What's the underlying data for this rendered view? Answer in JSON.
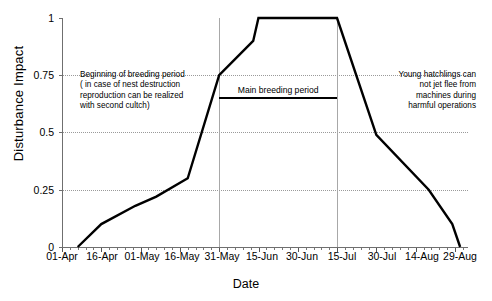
{
  "chart_data": {
    "type": "line",
    "title": "",
    "xlabel": "Date",
    "ylabel": "Disturbance Impact",
    "ylim": [
      0,
      1
    ],
    "yticks": [
      "0",
      "0.25",
      "0.5",
      "0.75",
      "1"
    ],
    "ytick_values": [
      0,
      0.25,
      0.5,
      0.75,
      1
    ],
    "grid": "horizontal-dotted",
    "legend": "none",
    "categories": [
      "01-Apr",
      "16-Apr",
      "01-May",
      "16-May",
      "31-May",
      "15-Jun",
      "30-Jun",
      "15-Jul",
      "30-Jul",
      "14-Aug",
      "29-Aug"
    ],
    "xtick_day_offsets": [
      0,
      15,
      30,
      45,
      60,
      75,
      90,
      105,
      120,
      135,
      150
    ],
    "series": [
      {
        "name": "Disturbance Impact",
        "points": [
          {
            "day": 6,
            "date": "07-Apr",
            "value": 0.0
          },
          {
            "day": 15,
            "date": "16-Apr",
            "value": 0.1
          },
          {
            "day": 28,
            "date": "29-Apr",
            "value": 0.18
          },
          {
            "day": 36,
            "date": "07-May",
            "value": 0.22
          },
          {
            "day": 48,
            "date": "19-May",
            "value": 0.3
          },
          {
            "day": 60,
            "date": "31-May",
            "value": 0.75
          },
          {
            "day": 73,
            "date": "13-Jun",
            "value": 0.9
          },
          {
            "day": 75,
            "date": "15-Jun",
            "value": 1.0
          },
          {
            "day": 105,
            "date": "15-Jul",
            "value": 1.0
          },
          {
            "day": 120,
            "date": "30-Jul",
            "value": 0.49
          },
          {
            "day": 140,
            "date": "19-Aug",
            "value": 0.25
          },
          {
            "day": 149,
            "date": "28-Aug",
            "value": 0.1
          },
          {
            "day": 152,
            "date": "31-Aug",
            "value": 0.0
          }
        ]
      }
    ],
    "vertical_markers": [
      {
        "day": 60,
        "label": "31-May"
      },
      {
        "day": 105,
        "label": "15-Jul"
      }
    ],
    "annotations": [
      {
        "id": "beginning-of-breeding-period",
        "text": "Beginning of breeding period ( in case of nest destruction reproduction can be realized with second cultch)",
        "lines": [
          "Beginning of breeding period",
          "( in case of nest destruction",
          "reproduction can be realized",
          "with second cultch)"
        ],
        "align": "left"
      },
      {
        "id": "main-breeding-period",
        "text": "Main breeding period",
        "lines": [
          "Main breeding period"
        ],
        "align": "center",
        "bar_value": 0.655,
        "bar_start_day": 60,
        "bar_end_day": 105
      },
      {
        "id": "young-hatchlings",
        "text": "Young hatchlings can not jet flee from machines during harmful operations",
        "lines": [
          "Young hatchlings can",
          "not jet flee from",
          "machines during",
          "harmful operations"
        ],
        "align": "right"
      }
    ],
    "colors": {
      "series": "#000000",
      "grid": "#9a9a9a",
      "axis": "#6f6f6f",
      "marker_line": "#a8a8a8",
      "background": "#ffffff"
    }
  },
  "axis": {
    "y_label": "Disturbance Impact",
    "x_label": "Date",
    "y_ticks": [
      "1",
      "0.75",
      "0.5",
      "0.25",
      "0"
    ],
    "x_ticks": [
      "01-Apr",
      "16-Apr",
      "01-May",
      "16-May",
      "31-May",
      "15-Jun",
      "30-Jun",
      "15-Jul",
      "30-Jul",
      "14-Aug",
      "29-Aug"
    ]
  },
  "annotation_text": {
    "begin_line1": "Beginning of breeding period",
    "begin_line2": "( in case of nest destruction",
    "begin_line3": "reproduction can be realized",
    "begin_line4": "with second cultch)",
    "main": "Main breeding period",
    "right_line1": "Young hatchlings can",
    "right_line2": "not jet flee from",
    "right_line3": "machines during",
    "right_line4": "harmful operations"
  }
}
